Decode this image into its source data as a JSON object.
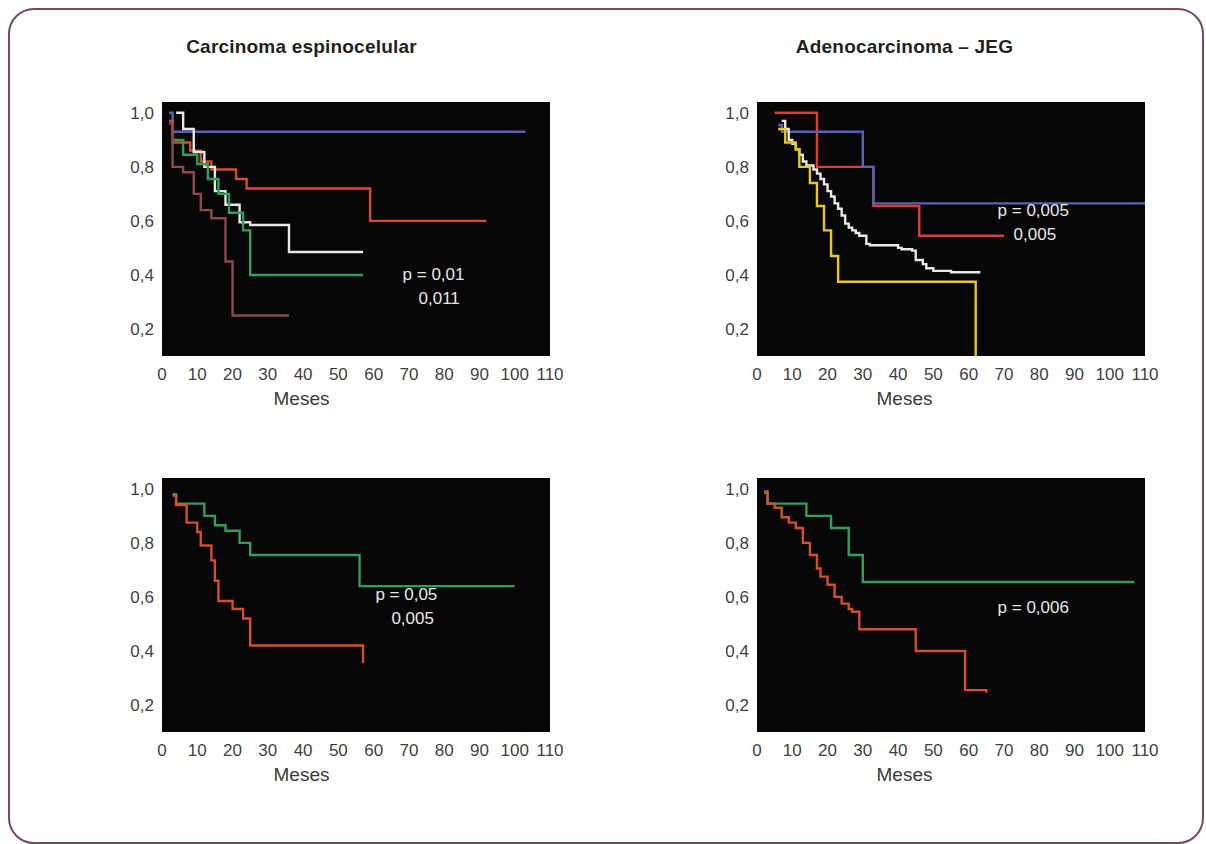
{
  "figure": {
    "frame_color": "#7a4a52",
    "background": "#ffffff",
    "plot_background": "#070606",
    "x_axis_label": "Meses",
    "y_ticks": [
      "1,0",
      "0,8",
      "0,6",
      "0,4",
      "0,2"
    ],
    "y_tick_values": [
      1.0,
      0.8,
      0.6,
      0.4,
      0.2
    ],
    "x_ticks": [
      "0",
      "10",
      "20",
      "30",
      "40",
      "50",
      "60",
      "70",
      "80",
      "90",
      "100",
      "110"
    ],
    "x_tick_values": [
      0,
      10,
      20,
      30,
      40,
      50,
      60,
      70,
      80,
      90,
      100,
      110
    ]
  },
  "chart_data": [
    {
      "id": "top-left",
      "type": "line",
      "title": "Carcinoma espinocelular",
      "xlabel": "Meses",
      "ylabel": "",
      "xlim": [
        0,
        110
      ],
      "ylim": [
        0.1,
        1.04
      ],
      "grid": false,
      "legend": "none",
      "annotations": [
        "p = 0,01",
        "0,011"
      ],
      "annotation_x": 0.62,
      "annotation_y": 0.3,
      "series": [
        {
          "name": "blue",
          "color": "#5a62b4",
          "points": [
            [
              2,
              1.0
            ],
            [
              3,
              0.93
            ],
            [
              103,
              0.93
            ]
          ]
        },
        {
          "name": "orange",
          "color": "#d2502a",
          "points": [
            [
              2,
              0.97
            ],
            [
              3,
              0.89
            ],
            [
              7,
              0.89
            ],
            [
              8,
              0.86
            ],
            [
              10,
              0.86
            ],
            [
              11,
              0.82
            ],
            [
              13,
              0.82
            ],
            [
              14,
              0.79
            ],
            [
              20,
              0.79
            ],
            [
              21,
              0.755
            ],
            [
              23,
              0.755
            ],
            [
              24,
              0.72
            ],
            [
              58,
              0.72
            ],
            [
              59,
              0.6
            ],
            [
              92,
              0.6
            ]
          ]
        },
        {
          "name": "white",
          "color": "#e8e8e6",
          "points": [
            [
              4,
              1.0
            ],
            [
              5,
              1.0
            ],
            [
              6,
              0.94
            ],
            [
              8,
              0.94
            ],
            [
              9,
              0.855
            ],
            [
              11,
              0.855
            ],
            [
              12,
              0.8
            ],
            [
              14,
              0.8
            ],
            [
              15,
              0.71
            ],
            [
              17,
              0.71
            ],
            [
              18,
              0.66
            ],
            [
              21,
              0.66
            ],
            [
              22,
              0.595
            ],
            [
              24,
              0.595
            ],
            [
              25,
              0.585
            ],
            [
              35,
              0.585
            ],
            [
              36,
              0.485
            ],
            [
              57,
              0.485
            ]
          ]
        },
        {
          "name": "green",
          "color": "#2fa05c",
          "points": [
            [
              3,
              0.9
            ],
            [
              5,
              0.9
            ],
            [
              6,
              0.845
            ],
            [
              9,
              0.845
            ],
            [
              10,
              0.81
            ],
            [
              12,
              0.81
            ],
            [
              13,
              0.755
            ],
            [
              15,
              0.755
            ],
            [
              16,
              0.7
            ],
            [
              18,
              0.7
            ],
            [
              19,
              0.63
            ],
            [
              22,
              0.63
            ],
            [
              23,
              0.565
            ],
            [
              24,
              0.565
            ],
            [
              25,
              0.4
            ],
            [
              57,
              0.4
            ]
          ]
        },
        {
          "name": "maroon",
          "color": "#8c4a50",
          "points": [
            [
              2,
              0.96
            ],
            [
              3,
              0.8
            ],
            [
              5,
              0.8
            ],
            [
              6,
              0.78
            ],
            [
              8,
              0.78
            ],
            [
              9,
              0.7
            ],
            [
              10,
              0.7
            ],
            [
              11,
              0.64
            ],
            [
              13,
              0.64
            ],
            [
              14,
              0.61
            ],
            [
              17,
              0.61
            ],
            [
              18,
              0.45
            ],
            [
              19,
              0.45
            ],
            [
              20,
              0.25
            ],
            [
              36,
              0.25
            ]
          ]
        }
      ]
    },
    {
      "id": "top-right",
      "type": "line",
      "title": "Adenocarcinoma – JEG",
      "xlabel": "Meses",
      "ylabel": "",
      "xlim": [
        0,
        110
      ],
      "ylim": [
        0.1,
        1.04
      ],
      "grid": false,
      "legend": "none",
      "annotations": [
        "p = 0,005",
        "0,005"
      ],
      "annotation_x": 0.62,
      "annotation_y": 0.55,
      "series": [
        {
          "name": "red",
          "color": "#e03b2f",
          "points": [
            [
              5,
              1.0
            ],
            [
              16,
              1.0
            ],
            [
              17,
              0.8
            ],
            [
              32,
              0.8
            ],
            [
              33,
              0.655
            ],
            [
              45,
              0.655
            ],
            [
              46,
              0.545
            ],
            [
              70,
              0.545
            ]
          ]
        },
        {
          "name": "blue",
          "color": "#5a62b4",
          "points": [
            [
              6,
              0.955
            ],
            [
              7,
              0.93
            ],
            [
              29,
              0.93
            ],
            [
              30,
              0.8
            ],
            [
              32,
              0.8
            ],
            [
              33,
              0.665
            ],
            [
              110,
              0.665
            ]
          ]
        },
        {
          "name": "white",
          "color": "#e8e8e6",
          "points": [
            [
              7,
              0.97
            ],
            [
              8,
              0.94
            ],
            [
              9,
              0.9
            ],
            [
              10,
              0.885
            ],
            [
              11,
              0.865
            ],
            [
              12,
              0.845
            ],
            [
              13,
              0.82
            ],
            [
              14,
              0.805
            ],
            [
              16,
              0.79
            ],
            [
              17,
              0.775
            ],
            [
              18,
              0.755
            ],
            [
              19,
              0.735
            ],
            [
              20,
              0.71
            ],
            [
              21,
              0.69
            ],
            [
              22,
              0.665
            ],
            [
              23,
              0.645
            ],
            [
              24,
              0.62
            ],
            [
              25,
              0.59
            ],
            [
              26,
              0.575
            ],
            [
              27,
              0.565
            ],
            [
              28,
              0.555
            ],
            [
              29,
              0.545
            ],
            [
              31,
              0.515
            ],
            [
              32,
              0.51
            ],
            [
              40,
              0.5
            ],
            [
              41,
              0.495
            ],
            [
              44,
              0.49
            ],
            [
              45,
              0.455
            ],
            [
              47,
              0.44
            ],
            [
              48,
              0.425
            ],
            [
              50,
              0.415
            ],
            [
              55,
              0.41
            ],
            [
              63,
              0.405
            ]
          ]
        },
        {
          "name": "yellow",
          "color": "#e8c81e",
          "points": [
            [
              6,
              0.94
            ],
            [
              8,
              0.89
            ],
            [
              10,
              0.89
            ],
            [
              11,
              0.865
            ],
            [
              12,
              0.8
            ],
            [
              14,
              0.8
            ],
            [
              15,
              0.74
            ],
            [
              16,
              0.74
            ],
            [
              17,
              0.655
            ],
            [
              18,
              0.655
            ],
            [
              19,
              0.565
            ],
            [
              20,
              0.565
            ],
            [
              21,
              0.47
            ],
            [
              22,
              0.47
            ],
            [
              23,
              0.375
            ],
            [
              61,
              0.375
            ],
            [
              62,
              0.1
            ]
          ]
        }
      ]
    },
    {
      "id": "bottom-left",
      "type": "line",
      "title": "",
      "xlabel": "Meses",
      "ylabel": "",
      "xlim": [
        0,
        110
      ],
      "ylim": [
        0.1,
        1.04
      ],
      "grid": false,
      "legend": "none",
      "annotations": [
        "p = 0,05",
        "0,005"
      ],
      "annotation_x": 0.55,
      "annotation_y": 0.52,
      "series": [
        {
          "name": "green",
          "color": "#2fa05c",
          "points": [
            [
              3,
              0.98
            ],
            [
              4,
              0.945
            ],
            [
              11,
              0.945
            ],
            [
              12,
              0.9
            ],
            [
              14,
              0.9
            ],
            [
              15,
              0.865
            ],
            [
              17,
              0.865
            ],
            [
              18,
              0.845
            ],
            [
              21,
              0.845
            ],
            [
              22,
              0.8
            ],
            [
              24,
              0.8
            ],
            [
              25,
              0.755
            ],
            [
              55,
              0.755
            ],
            [
              56,
              0.64
            ],
            [
              100,
              0.64
            ]
          ]
        },
        {
          "name": "orange",
          "color": "#d2502a",
          "points": [
            [
              3,
              0.975
            ],
            [
              4,
              0.94
            ],
            [
              6,
              0.94
            ],
            [
              7,
              0.875
            ],
            [
              9,
              0.875
            ],
            [
              10,
              0.84
            ],
            [
              11,
              0.79
            ],
            [
              13,
              0.79
            ],
            [
              14,
              0.735
            ],
            [
              15,
              0.66
            ],
            [
              16,
              0.585
            ],
            [
              19,
              0.585
            ],
            [
              20,
              0.555
            ],
            [
              22,
              0.555
            ],
            [
              23,
              0.52
            ],
            [
              24,
              0.52
            ],
            [
              25,
              0.42
            ],
            [
              56,
              0.42
            ],
            [
              57,
              0.355
            ]
          ]
        }
      ]
    },
    {
      "id": "bottom-right",
      "type": "line",
      "title": "",
      "xlabel": "Meses",
      "ylabel": "",
      "xlim": [
        0,
        110
      ],
      "ylim": [
        0.1,
        1.04
      ],
      "grid": false,
      "legend": "none",
      "annotations": [
        "p = 0,006"
      ],
      "annotation_x": 0.62,
      "annotation_y": 0.47,
      "series": [
        {
          "name": "green",
          "color": "#2fa05c",
          "points": [
            [
              2,
              0.985
            ],
            [
              3,
              0.945
            ],
            [
              13,
              0.945
            ],
            [
              14,
              0.9
            ],
            [
              20,
              0.9
            ],
            [
              21,
              0.855
            ],
            [
              25,
              0.855
            ],
            [
              26,
              0.755
            ],
            [
              29,
              0.755
            ],
            [
              30,
              0.655
            ],
            [
              107,
              0.655
            ]
          ]
        },
        {
          "name": "orange",
          "color": "#d2502a",
          "points": [
            [
              2,
              0.99
            ],
            [
              3,
              0.945
            ],
            [
              5,
              0.93
            ],
            [
              7,
              0.895
            ],
            [
              9,
              0.875
            ],
            [
              11,
              0.855
            ],
            [
              13,
              0.8
            ],
            [
              15,
              0.755
            ],
            [
              17,
              0.705
            ],
            [
              18,
              0.675
            ],
            [
              20,
              0.645
            ],
            [
              22,
              0.6
            ],
            [
              24,
              0.575
            ],
            [
              26,
              0.555
            ],
            [
              27,
              0.545
            ],
            [
              29,
              0.48
            ],
            [
              44,
              0.48
            ],
            [
              45,
              0.4
            ],
            [
              58,
              0.4
            ],
            [
              59,
              0.255
            ],
            [
              65,
              0.245
            ]
          ]
        }
      ]
    }
  ]
}
